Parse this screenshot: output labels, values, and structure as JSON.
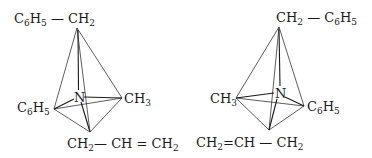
{
  "diagram": {
    "type": "stereochemistry-enantiomers",
    "molecules": [
      {
        "id": "left",
        "center": "N",
        "substituents": {
          "top": {
            "parts": [
              "C",
              "6",
              "H",
              "5",
              " — CH",
              "2"
            ],
            "text": "C6H5—CH2"
          },
          "right": {
            "parts": [
              "CH",
              "3"
            ],
            "text": "CH3"
          },
          "left": {
            "parts": [
              "C",
              "6",
              "H",
              "5"
            ],
            "text": "C6H5"
          },
          "bottom": {
            "parts": [
              "CH",
              "2",
              "— CH = CH",
              "2"
            ],
            "text": "CH2—CH=CH2"
          }
        }
      },
      {
        "id": "right",
        "center": "N",
        "substituents": {
          "top": {
            "parts": [
              "CH",
              "2",
              " — C",
              "6",
              "H",
              "5"
            ],
            "text": "CH2—C6H5"
          },
          "left": {
            "parts": [
              "CH",
              "3"
            ],
            "text": "CH3"
          },
          "right": {
            "parts": [
              "C",
              "6",
              "H",
              "5"
            ],
            "text": "C6H5"
          },
          "bottom": {
            "parts": [
              "CH",
              "2",
              "=CH — CH",
              "2"
            ],
            "text": "CH2=CH—CH2"
          }
        }
      }
    ],
    "colors": {
      "line": "#333333",
      "text": "#1a1a1a",
      "background": "#ffffff"
    }
  }
}
